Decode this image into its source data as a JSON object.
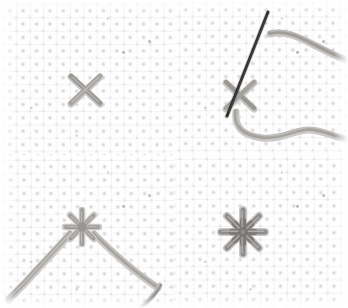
{
  "image": {
    "title": "Cross-stitch star (Algerian eye) stitch tutorial — four step photographs",
    "medium": "Scanned photograph sequence on aida cloth",
    "layout": "2 x 2 panel grid, 348 x 308 pixels",
    "background_color": "#ffffff"
  },
  "colors": {
    "paper": "#ffffff",
    "cloth": "#fefefe",
    "weave_dot": "#b0b2ba",
    "weave_line": "#cdcfd5",
    "floss_light": "#b9b7b4",
    "floss_mid": "#9b9894",
    "floss_dark": "#7d7a77",
    "needle": "#2a2a2a",
    "shadow": "#c8c6c4"
  },
  "panels": [
    {
      "id": "panel-1",
      "position": "top-left",
      "step_number": "1",
      "caption": "A single cross stitch worked on the aida cloth",
      "subject": "cross-stitch",
      "cross": {
        "center_x": 85,
        "center_y": 90,
        "size": 30,
        "color": "#9b9894"
      },
      "has_needle": false,
      "thread_count": 0
    },
    {
      "id": "panel-2",
      "position": "top-right",
      "step_number": "2",
      "caption": "Needle and floss brought up through the centre of the cross",
      "subject": "cross-stitch-with-needle",
      "cross": {
        "center_x": 240,
        "center_y": 96,
        "size": 30,
        "color": "#9b9894"
      },
      "has_needle": true,
      "needle": {
        "x1": 268,
        "y1": 12,
        "x2": 227,
        "y2": 116,
        "color": "#2a2a2a",
        "width": 2.6
      },
      "thread_count": 2
    },
    {
      "id": "panel-3",
      "position": "bottom-left",
      "step_number": "3",
      "caption": "Further straight stitches added, two floss strands trailing off",
      "subject": "partial-star-stitch",
      "star": {
        "center_x": 82,
        "center_y": 227,
        "radius": 18,
        "points": 8,
        "color": "#9b9894"
      },
      "has_needle": false,
      "thread_count": 2
    },
    {
      "id": "panel-4",
      "position": "bottom-right",
      "step_number": "4",
      "caption": "The completed eight-pointed star stitch",
      "subject": "finished-star-stitch",
      "star": {
        "center_x": 243,
        "center_y": 232,
        "radius": 22,
        "points": 8,
        "color": "#8e8b88"
      },
      "has_needle": false,
      "thread_count": 0
    }
  ],
  "cloth_grid": {
    "pitch_px": 13.4,
    "dot_color": "#b0b2ba",
    "description": "Even grid of woven holes in the aida fabric"
  }
}
